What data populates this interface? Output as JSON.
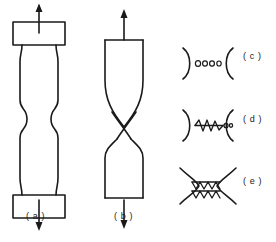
{
  "figure": {
    "background_color": "#ffffff",
    "line_color": "#1a1a1a",
    "labels": {
      "a": "( a )",
      "b": "( b )",
      "c": "( c )",
      "d": "( d )",
      "e": "( e )"
    },
    "panels": [
      {
        "key": "a",
        "name": "cup-and-cone-necked-specimen",
        "label": "( a )",
        "description": "Round tensile bar with square grip heads at top and bottom, smoothly necked (waisted) gauge section at mid-height, load arrows pointing up at top and down at bottom."
      },
      {
        "key": "b",
        "name": "chisel-point-ductile-specimen",
        "label": "( b )",
        "description": "Fully ductile tensile bar drawn down to a chisel point; the two tapered halves cross in an X at mid-height, load arrows pointing up at top and down at bottom."
      },
      {
        "key": "c",
        "name": "void-nucleation-detail",
        "label": "( c )",
        "description": "Two opposing curved fracture faces with a row of small round voids nucleated between them.",
        "voids": 4
      },
      {
        "key": "d",
        "name": "void-coalescence-detail",
        "label": "( d )",
        "description": "Two opposing curved fracture faces with the voids elongated and linked into a jagged internal crack.",
        "voids": 5
      },
      {
        "key": "e",
        "name": "shear-fracture-detail",
        "label": "( e )",
        "description": "Two wavy fracture faces nearly joined, connected by a zigzag shear band of serrated ligaments."
      }
    ],
    "arrows": [
      {
        "name": "tensile-load-arrow-up-a",
        "direction": "up",
        "panel": "a"
      },
      {
        "name": "tensile-load-arrow-down-a",
        "direction": "down",
        "panel": "a"
      },
      {
        "name": "tensile-load-arrow-up-b",
        "direction": "up",
        "panel": "b"
      },
      {
        "name": "tensile-load-arrow-down-b",
        "direction": "down",
        "panel": "b"
      }
    ]
  }
}
